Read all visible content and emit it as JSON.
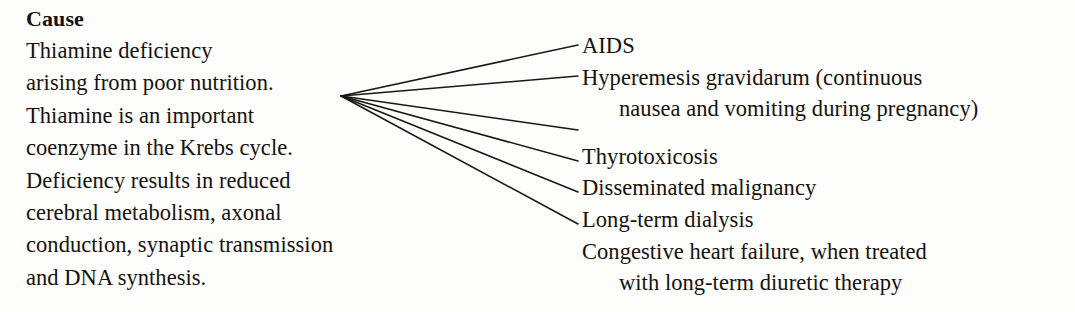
{
  "document": {
    "background_color": "#fdfdfc",
    "text_color": "#15120f",
    "line_color": "#1a1714"
  },
  "left": {
    "heading": "Cause",
    "body": "Thiamine deficiency\narising from poor nutrition.\nThiamine is an important\ncoenzyme in the Krebs cycle.\nDeficiency results in reduced\ncerebral metabolism, axonal\nconduction, synaptic transmission\nand DNA synthesis."
  },
  "right": {
    "items": [
      {
        "text": "AIDS",
        "continuation": ""
      },
      {
        "text": "Hyperemesis gravidarum (continuous",
        "continuation": "nausea and vomiting during pregnancy)"
      },
      {
        "text": "Thyrotoxicosis",
        "continuation": ""
      },
      {
        "text": "Disseminated malignancy",
        "continuation": ""
      },
      {
        "text": "Long-term dialysis",
        "continuation": ""
      },
      {
        "text": "Congestive heart failure, when treated",
        "continuation": "with long-term diuretic therapy"
      }
    ]
  },
  "connectors": {
    "origin": {
      "x": 341,
      "y": 96
    },
    "endpoints": [
      {
        "x": 578,
        "y": 45
      },
      {
        "x": 578,
        "y": 76
      },
      {
        "x": 578,
        "y": 130
      },
      {
        "x": 578,
        "y": 161
      },
      {
        "x": 578,
        "y": 192
      },
      {
        "x": 578,
        "y": 224
      }
    ]
  }
}
